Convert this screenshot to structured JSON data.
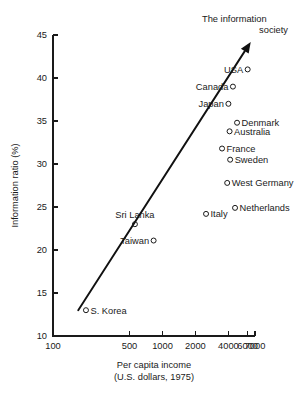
{
  "chart_data": {
    "type": "scatter",
    "title": "",
    "xlabel": "Per capita income",
    "xlabel_sub": "(U.S. dollars, 1975)",
    "ylabel": "Information ratio (%)",
    "xscale": "log",
    "xlim": [
      100,
      7000
    ],
    "ylim": [
      10,
      45
    ],
    "grid": false,
    "legend": null,
    "xticks": [
      100,
      500,
      1000,
      2000,
      4000,
      6000,
      7000
    ],
    "xtick_labels": [
      "100",
      "500",
      "1000",
      "2000",
      "4000",
      "6000",
      "7000"
    ],
    "yticks": [
      10,
      15,
      20,
      25,
      30,
      35,
      40,
      45
    ],
    "ytick_labels": [
      "10",
      "15",
      "20",
      "25",
      "30",
      "35",
      "40",
      "45"
    ],
    "annotations": [
      {
        "id": "information-society",
        "line1": "The information",
        "line2": "society"
      }
    ],
    "trend": {
      "id": "information-society-trend",
      "x_start": 170,
      "y_start": 13.0,
      "x_end": 6400,
      "y_end": 44.2,
      "arrow": true
    },
    "points": [
      {
        "name": "USA",
        "x": 6000,
        "y": 41.0,
        "label": "USA",
        "label_side": "left"
      },
      {
        "name": "Canada",
        "x": 4400,
        "y": 39.0,
        "label": "Canada",
        "label_side": "left"
      },
      {
        "name": "Japan",
        "x": 4000,
        "y": 37.0,
        "label": "Japan",
        "label_side": "left"
      },
      {
        "name": "Denmark",
        "x": 4800,
        "y": 34.8,
        "label": "Denmark",
        "label_side": "right"
      },
      {
        "name": "Australia",
        "x": 4100,
        "y": 33.8,
        "label": "Australia",
        "label_side": "right"
      },
      {
        "name": "France",
        "x": 3500,
        "y": 31.8,
        "label": "France",
        "label_side": "right"
      },
      {
        "name": "Sweden",
        "x": 4150,
        "y": 30.5,
        "label": "Sweden",
        "label_side": "right"
      },
      {
        "name": "West Germany",
        "x": 3900,
        "y": 27.8,
        "label": "West Germany",
        "label_side": "right"
      },
      {
        "name": "Netherlands",
        "x": 4600,
        "y": 24.9,
        "label": "Netherlands",
        "label_side": "right"
      },
      {
        "name": "Italy",
        "x": 2500,
        "y": 24.2,
        "label": "Italy",
        "label_side": "right"
      },
      {
        "name": "Sri Lanka",
        "x": 560,
        "y": 23.0,
        "label": "Sri Lanka",
        "label_side": "above"
      },
      {
        "name": "Taiwan",
        "x": 830,
        "y": 21.1,
        "label": "Taiwan",
        "label_side": "left"
      },
      {
        "name": "S. Korea",
        "x": 200,
        "y": 13.0,
        "label": "S. Korea",
        "label_side": "right"
      }
    ]
  }
}
